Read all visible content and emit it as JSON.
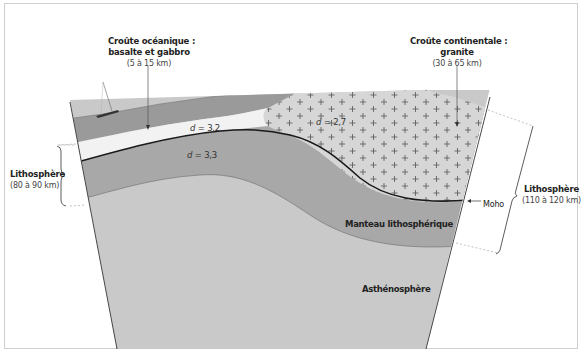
{
  "diagram": {
    "type": "geological cross-section",
    "colors": {
      "water": "#9a9a9a",
      "oceanic_crust": "#f2f2f2",
      "continental_crust": "#d6d6d6",
      "lithospheric_mantle": "#a8a8a8",
      "asthenosphere": "#c9c9c9",
      "moho_line": "#1a1a1a",
      "frame": "#cfcfcf"
    }
  },
  "labels": {
    "oceanic_crust": {
      "title_line1": "Croûte océanique :",
      "title_line2": "basalte et gabbro",
      "thickness": "(5 à 15 km)"
    },
    "continental_crust": {
      "title_line1": "Croûte continentale :",
      "title_line2": "granite",
      "thickness": "(30 à 65 km)"
    },
    "lithosphere_left": {
      "title": "Lithosphère",
      "thickness": "(80 à 90 km)"
    },
    "lithosphere_right": {
      "title": "Lithosphère",
      "thickness": "(110 à 120 km)"
    },
    "moho": "Moho",
    "lithospheric_mantle": "Manteau lithosphérique",
    "asthenosphere": "Asthénosphère"
  },
  "densities": {
    "oceanic_crust": {
      "symbol": "d",
      "value": "= 3,2"
    },
    "continental_crust": {
      "symbol": "d",
      "value": "= 2,7"
    },
    "lithospheric_mantle": {
      "symbol": "d",
      "value": "= 3,3"
    }
  }
}
